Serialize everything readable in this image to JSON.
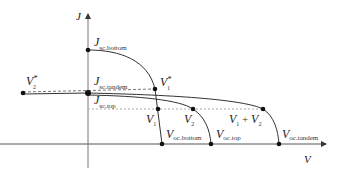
{
  "axes": {
    "y_label": "J",
    "x_label": "V"
  },
  "labels": {
    "jsc_bottom": {
      "main": "J",
      "sub": "sc.bottom"
    },
    "jsc_tandem": {
      "main": "J",
      "sub": "sc.tandem"
    },
    "jsc_top": {
      "main": "J",
      "sub": "sc.top"
    },
    "v1_star": {
      "main": "V",
      "sub": "1",
      "sup": "*"
    },
    "v2_star": {
      "main": "V",
      "sub": "2",
      "sup": "*"
    },
    "v1": {
      "main": "V",
      "sub": "1"
    },
    "v2": {
      "main": "V",
      "sub": "2"
    },
    "v1_plus_v2": {
      "a": "V",
      "a_sub": "1",
      "op": " + ",
      "b": "V",
      "b_sub": "2"
    },
    "voc_bottom": {
      "main": "V",
      "sub": "oc.bottom"
    },
    "voc_top": {
      "main": "V",
      "sub": "oc.top"
    },
    "voc_tandem": {
      "main": "V",
      "sub": "oc.tandem"
    }
  },
  "colors": {
    "curve": "#333333",
    "axis": "#555555",
    "dashed": "#777777",
    "dotted": "#aaaaaa",
    "point": "#111111"
  }
}
